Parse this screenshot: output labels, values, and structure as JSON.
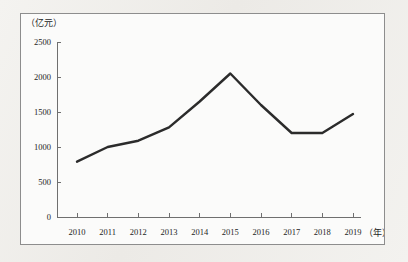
{
  "figure": {
    "background_color": "#fbfbfa",
    "page_background_color": "#f2f1ee",
    "border_color": "#8d8d8d"
  },
  "chart_data": {
    "type": "line",
    "title": "",
    "subtitle": "",
    "xlabel": "（年）",
    "ylabel": "（亿元）",
    "categories": [
      "2010",
      "2011",
      "2012",
      "2013",
      "2014",
      "2015",
      "2016",
      "2017",
      "2018",
      "2019"
    ],
    "x": [
      2010,
      2011,
      2012,
      2013,
      2014,
      2015,
      2016,
      2017,
      2018,
      2019
    ],
    "values": [
      790,
      1000,
      1090,
      1280,
      1650,
      2050,
      1600,
      1200,
      1200,
      1470
    ],
    "series": [
      {
        "name": "",
        "values": [
          790,
          1000,
          1090,
          1280,
          1650,
          2050,
          1600,
          1200,
          1200,
          1470
        ],
        "color": "#2b2b2b",
        "line_width": 2.4,
        "markers": false
      }
    ],
    "ylim": [
      0,
      2500
    ],
    "yticks": [
      0,
      500,
      1000,
      1500,
      2000,
      2500
    ],
    "ytick_labels": [
      "0",
      "500",
      "1000",
      "1500",
      "2000",
      "2500"
    ],
    "xtick_labels": [
      "2010",
      "2011",
      "2012",
      "2013",
      "2014",
      "2015",
      "2016",
      "2017",
      "2018",
      "2019"
    ],
    "grid": false,
    "legend": false,
    "legend_position": "none",
    "annotations": []
  },
  "axes": {
    "y_unit_label": "（亿元）",
    "x_unit_label": "（年）",
    "axis_color": "#6f6f6f"
  }
}
